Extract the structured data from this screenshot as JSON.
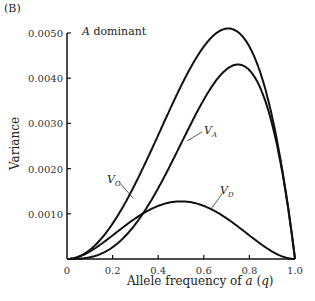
{
  "panel_label": "(B)",
  "annotation": "A dominant",
  "chart_data": {
    "type": "line",
    "title": "A dominant",
    "xlabel": "Allele frequency of a (q)",
    "ylabel": "Variance",
    "xlim": [
      0,
      1.0
    ],
    "ylim": [
      0,
      0.005
    ],
    "x_ticks": [
      "0",
      "0.2",
      "0.4",
      "0.6",
      "0.8",
      "1.0"
    ],
    "y_ticks": [
      "0.0010",
      "0.0020",
      "0.0030",
      "0.0040",
      "0.0050"
    ],
    "grid": false,
    "a_squared": 0.0051,
    "series": [
      {
        "name": "V_G",
        "label": "VG",
        "formula": "VA+VD",
        "peak": {
          "q": 0.71,
          "v": 0.005
        }
      },
      {
        "name": "V_A",
        "label": "VA",
        "formula": "8pq^3a^2",
        "peak": {
          "q": 0.75,
          "v": 0.0043
        }
      },
      {
        "name": "V_D",
        "label": "VD",
        "formula": "4p^2q^2a^2",
        "peak": {
          "q": 0.5,
          "v": 0.0013
        }
      }
    ]
  }
}
